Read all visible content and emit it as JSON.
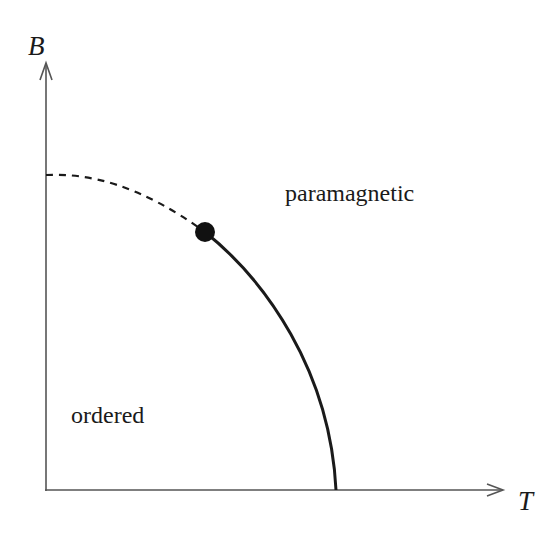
{
  "diagram": {
    "type": "phase-diagram",
    "axes": {
      "x": {
        "label": "T"
      },
      "y": {
        "label": "B"
      }
    },
    "regions": [
      {
        "id": "paramagnetic",
        "label": "paramagnetic"
      },
      {
        "id": "ordered",
        "label": "ordered"
      }
    ],
    "lines": [
      {
        "id": "first-order-boundary",
        "style": "dashed",
        "description": "from B-axis to critical point"
      },
      {
        "id": "second-order-boundary",
        "style": "solid",
        "description": "from critical point down to T-axis"
      }
    ],
    "points": [
      {
        "id": "tricritical-point",
        "style": "filled-circle"
      }
    ],
    "colors": {
      "ink": "#1a1a1a",
      "axis": "#555555",
      "background": "#ffffff"
    }
  }
}
